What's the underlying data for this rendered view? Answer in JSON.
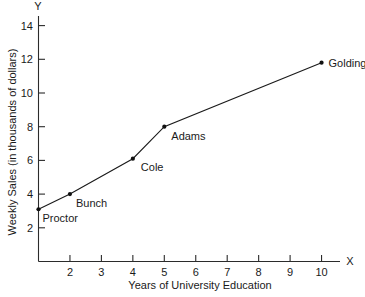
{
  "chart_data": {
    "type": "line",
    "title": "",
    "xlabel": "Years of University Education",
    "ylabel": "Weekly Sales (in thousands of dollars)",
    "x_axis_name": "X",
    "y_axis_name": "Y",
    "xlim": [
      0.5,
      11.2
    ],
    "ylim": [
      0,
      15.2
    ],
    "grid": false,
    "legend": "none",
    "x_ticks": [
      2,
      3,
      4,
      5,
      6,
      7,
      8,
      9,
      10
    ],
    "x_tick_labels": [
      "2",
      "3",
      "4",
      "5",
      "6",
      "7",
      "8",
      "9",
      "10"
    ],
    "y_ticks": [
      2,
      4,
      6,
      8,
      10,
      12,
      14
    ],
    "y_tick_labels": [
      "2",
      "4",
      "6",
      "8",
      "10",
      "12",
      "14"
    ],
    "x": [
      1,
      2,
      4,
      5,
      10
    ],
    "values": [
      3.1,
      4.0,
      6.1,
      8.0,
      11.8
    ],
    "point_labels": [
      "Proctor",
      "Bunch",
      "Cole",
      "Adams",
      "Golding"
    ],
    "points": [
      {
        "label": "Proctor",
        "x": 1,
        "y": 3.1,
        "label_dx": 4,
        "label_dy": 13,
        "anchor": "start"
      },
      {
        "label": "Bunch",
        "x": 2,
        "y": 4.0,
        "label_dx": 6,
        "label_dy": 13,
        "anchor": "start"
      },
      {
        "label": "Cole",
        "x": 4,
        "y": 6.1,
        "label_dx": 8,
        "label_dy": 12,
        "anchor": "start"
      },
      {
        "label": "Adams",
        "x": 5,
        "y": 8.0,
        "label_dx": 7,
        "label_dy": 13,
        "anchor": "start"
      },
      {
        "label": "Golding",
        "x": 10,
        "y": 11.8,
        "label_dx": 7,
        "label_dy": 4,
        "anchor": "start"
      }
    ]
  }
}
